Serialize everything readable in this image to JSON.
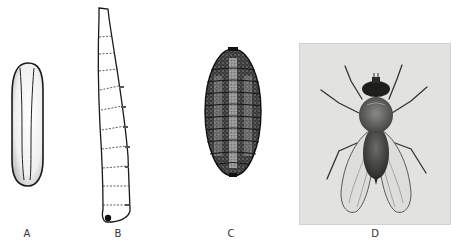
{
  "figure": {
    "panels": [
      {
        "id": "A",
        "label": "A",
        "subject": "egg",
        "style": "line drawing, stippled"
      },
      {
        "id": "B",
        "label": "B",
        "subject": "larva",
        "style": "segmented line drawing"
      },
      {
        "id": "C",
        "label": "C",
        "subject": "pupa",
        "style": "dark stippled drawing"
      },
      {
        "id": "D",
        "label": "D",
        "subject": "adult fly",
        "style": "photograph"
      }
    ]
  },
  "colors": {
    "background": "#ffffff",
    "ink": "#1a1a1a",
    "photo_bg": "#e2e2e0",
    "label": "#333333"
  }
}
